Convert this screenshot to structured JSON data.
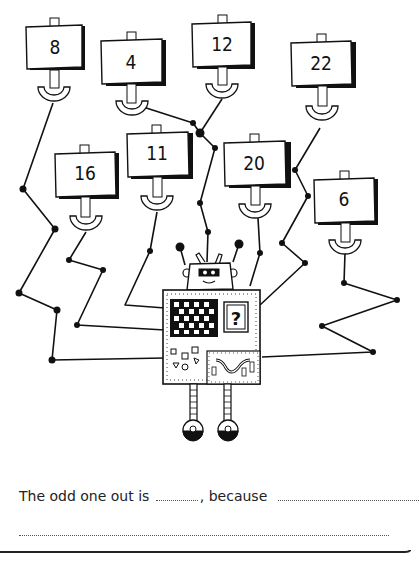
{
  "worksheet": {
    "signs": [
      {
        "id": "sign-8",
        "value": "8"
      },
      {
        "id": "sign-4",
        "value": "4"
      },
      {
        "id": "sign-12",
        "value": "12"
      },
      {
        "id": "sign-22",
        "value": "22"
      },
      {
        "id": "sign-16",
        "value": "16"
      },
      {
        "id": "sign-11",
        "value": "11"
      },
      {
        "id": "sign-20",
        "value": "20"
      },
      {
        "id": "sign-6",
        "value": "6"
      }
    ],
    "robot": {
      "screen_symbol": "?"
    },
    "question": {
      "prefix": "The odd one out is",
      "middle": ", because",
      "answer_blank": "",
      "reason_blank": "",
      "reason_line2": ""
    }
  }
}
